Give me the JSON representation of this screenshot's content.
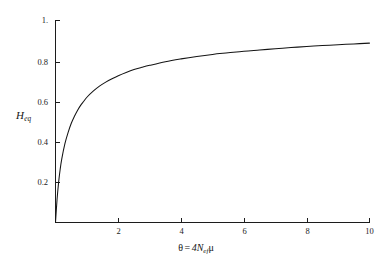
{
  "chart_data": {
    "type": "line",
    "title": "",
    "subtitle": "",
    "xlabel": "θ = 4Nefμ",
    "xlabel_parts": {
      "theta": "θ",
      "equals": "=",
      "coefficient": "4",
      "variable": "N",
      "subscript": "ef",
      "mu": "μ"
    },
    "ylabel": "Heq",
    "ylabel_parts": {
      "base": "H",
      "subscript": "eq"
    },
    "xlim": [
      0,
      10
    ],
    "ylim": [
      0,
      1
    ],
    "xticks": [
      2,
      4,
      6,
      8,
      10
    ],
    "xtick_labels": [
      "2",
      "4",
      "6",
      "8",
      "10"
    ],
    "yticks": [
      0.2,
      0.4,
      0.6,
      0.8,
      1.0
    ],
    "ytick_labels": [
      "0.2",
      "0.4",
      "0.6",
      "0.8",
      "1."
    ],
    "grid": false,
    "legend": null,
    "legend_position": "none",
    "series": [
      {
        "name": "Heq",
        "color": "#141414",
        "equation": "Heq = θ / (1 + θ)",
        "x": [
          0,
          0.05,
          0.1,
          0.15,
          0.2,
          0.3,
          0.4,
          0.5,
          0.6,
          0.7,
          0.8,
          0.9,
          1.0,
          1.2,
          1.4,
          1.6,
          1.8,
          2.0,
          2.25,
          2.5,
          2.75,
          3.0,
          3.5,
          4.0,
          4.5,
          5.0,
          5.5,
          6.0,
          6.5,
          7.0,
          7.5,
          8.0,
          8.5,
          9.0,
          9.5,
          10.0
        ],
        "y": [
          0.0,
          0.115,
          0.2,
          0.265,
          0.315,
          0.39,
          0.445,
          0.49,
          0.525,
          0.555,
          0.58,
          0.6,
          0.62,
          0.65,
          0.675,
          0.695,
          0.712,
          0.727,
          0.743,
          0.757,
          0.768,
          0.778,
          0.796,
          0.81,
          0.822,
          0.832,
          0.84,
          0.848,
          0.854,
          0.86,
          0.866,
          0.871,
          0.876,
          0.88,
          0.884,
          0.888
        ]
      }
    ]
  }
}
